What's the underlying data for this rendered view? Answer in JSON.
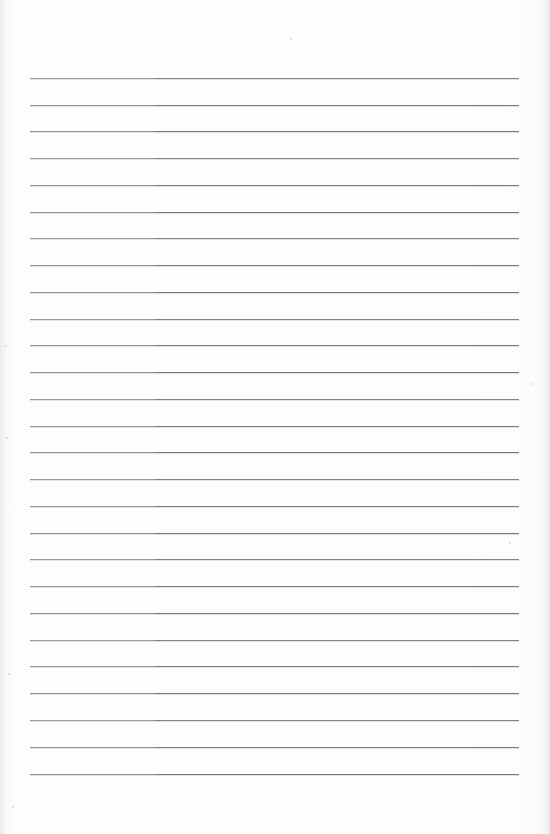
{
  "document": {
    "kind": "scanned-lined-paper",
    "title": "",
    "header_text": "",
    "body_text": "",
    "footer_text": "",
    "page_number": "",
    "is_blank": true
  },
  "canvas": {
    "width_px": 550,
    "height_px": 834,
    "background_color": "#fdfdfd",
    "paper_color": "#ffffff"
  },
  "ruling": {
    "line_color": "#6e6f71",
    "line_color_light_segment": "#8a8b8d",
    "line_thickness_px": 1,
    "line_count": 27,
    "first_line_y_px": 78,
    "line_spacing_px": 26.75,
    "left_margin_x_px": 30,
    "right_end_x_px": 519,
    "line_length_px": 489,
    "top_margin_px": 78,
    "bottom_margin_px": 60,
    "light_segment_width_px": 125,
    "lines_y_px": [
      78,
      105,
      131,
      158,
      185,
      212,
      238,
      265,
      292,
      319,
      345,
      372,
      399,
      426,
      452,
      479,
      506,
      533,
      559,
      586,
      613,
      640,
      666,
      693,
      720,
      747,
      774
    ]
  },
  "artifacts": {
    "specks": [
      {
        "x_px": 290,
        "y_px": 38,
        "size_px": 2
      },
      {
        "x_px": 530,
        "y_px": 383,
        "size_px": 2
      },
      {
        "x_px": 5,
        "y_px": 345,
        "size_px": 2
      },
      {
        "x_px": 6,
        "y_px": 437,
        "size_px": 2
      },
      {
        "x_px": 509,
        "y_px": 542,
        "size_px": 2
      },
      {
        "x_px": 8,
        "y_px": 673,
        "size_px": 2
      },
      {
        "x_px": 12,
        "y_px": 806,
        "size_px": 2
      }
    ]
  }
}
